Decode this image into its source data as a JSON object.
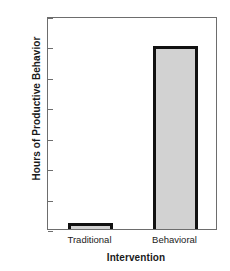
{
  "chart_data": {
    "type": "bar",
    "title": "",
    "xlabel": "Intervention",
    "ylabel": "Hours of Productive Behavior",
    "categories": [
      "Traditional",
      "Behavioral"
    ],
    "values": [
      0.2,
      6.0
    ],
    "ylim": [
      0,
      7
    ],
    "yticks": [
      0,
      1,
      2,
      3,
      4,
      5,
      6,
      7
    ],
    "ytick_labels": [
      "0",
      "1",
      "2",
      "3",
      "4",
      "5",
      "6",
      "7"
    ],
    "grid": false,
    "legend": false,
    "legend_position": "none",
    "bar_fill_color": "#d2d2d2",
    "bar_edge_color": "#111111",
    "frame_color": "#6d6d6d",
    "background_color": "#ffffff"
  }
}
